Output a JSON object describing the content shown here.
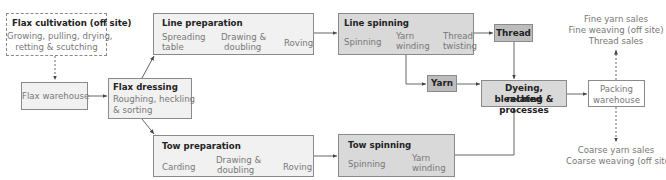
{
  "diagram": {
    "flax_cultivation": {
      "title": "Flax cultivation (off site)",
      "lines": [
        "Growing, pulling, drying,",
        "retting & scutching"
      ]
    },
    "flax_warehouse": {
      "label": "Flax warehouse"
    },
    "flax_dressing": {
      "title": "Flax dressing",
      "lines": [
        "Roughing, heckling",
        "& sorting"
      ]
    },
    "line_preparation": {
      "title": "Line preparation",
      "steps": [
        [
          "Spreading",
          "table"
        ],
        [
          "Drawing &",
          "doubling"
        ],
        [
          "Roving"
        ]
      ]
    },
    "tow_preparation": {
      "title": "Tow preparation",
      "steps": [
        [
          "Carding"
        ],
        [
          "Drawing &",
          "doubling"
        ],
        [
          "Roving"
        ]
      ]
    },
    "line_spinning": {
      "title": "Line spinning",
      "steps": [
        [
          "Spinning"
        ],
        [
          "Yarn",
          "winding"
        ],
        [
          "Thread",
          "twisting"
        ]
      ]
    },
    "tow_spinning": {
      "title": "Tow spinning",
      "steps": [
        [
          "Spinning"
        ],
        [
          "Yarn",
          "winding"
        ]
      ]
    },
    "thread": {
      "label": "Thread"
    },
    "yarn": {
      "label": "Yarn"
    },
    "dyeing": {
      "lines": [
        "Dyeing, bleaching &",
        "related processes"
      ]
    },
    "packing_warehouse": {
      "lines": [
        "Packing",
        "warehouse"
      ]
    },
    "fine_outputs": [
      "Fine yarn sales",
      "Fine weaving (off site)",
      "Thread sales"
    ],
    "coarse_outputs": [
      "Coarse yarn sales",
      "Coarse weaving (off site)"
    ]
  },
  "colors": {
    "border": "#8a8a8a",
    "light_fill": "#f1f1f1",
    "mid_fill": "#d9d9d9",
    "dark_fill": "#bdbdbd",
    "text_muted": "#777777",
    "text_dark": "#222222"
  }
}
